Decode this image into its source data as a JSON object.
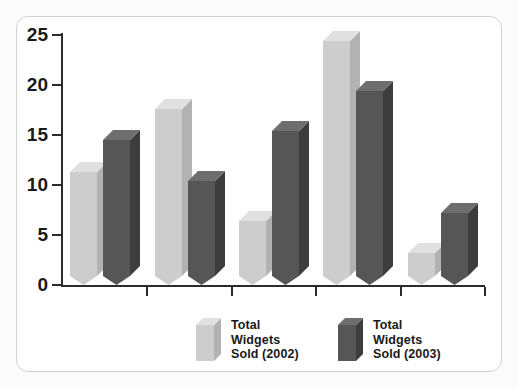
{
  "chart_data": {
    "type": "bar",
    "title": "",
    "subtitle": "",
    "xlabel": "",
    "ylabel": "",
    "categories": [
      "",
      "",
      "",
      "",
      ""
    ],
    "ylim": [
      0,
      25
    ],
    "yticks": [
      0,
      5,
      10,
      15,
      20,
      25
    ],
    "ytick_labels": [
      "0",
      "5",
      "10",
      "15",
      "20",
      "25"
    ],
    "grid": false,
    "legend_position": "bottom",
    "style": "3d-bars",
    "series": [
      {
        "name": "Total\nWidgets\nSold (2002)",
        "color": "#cdcdcd",
        "values": [
          11.3,
          17.6,
          6.4,
          24.4,
          3.2
        ]
      },
      {
        "name": "Total\nWidgets\nSold (2003)",
        "color": "#565656",
        "values": [
          14.5,
          10.4,
          15.4,
          19.4,
          7.2
        ]
      }
    ]
  },
  "legend": {
    "items": [
      {
        "label": "Total\nWidgets\nSold (2002)",
        "swatch": "light-bar-swatch"
      },
      {
        "label": "Total\nWidgets\nSold (2003)",
        "swatch": "dark-bar-swatch"
      }
    ]
  },
  "colors": {
    "light_front": "#cdcdcd",
    "light_side": "#b2b2b2",
    "light_top": "#e0e0e0",
    "dark_front": "#565656",
    "dark_side": "#3d3d3d",
    "dark_top": "#6e6e6e",
    "axis": "#2b2b2b",
    "frame": "#d2d2d2",
    "background": "#ffffff"
  }
}
